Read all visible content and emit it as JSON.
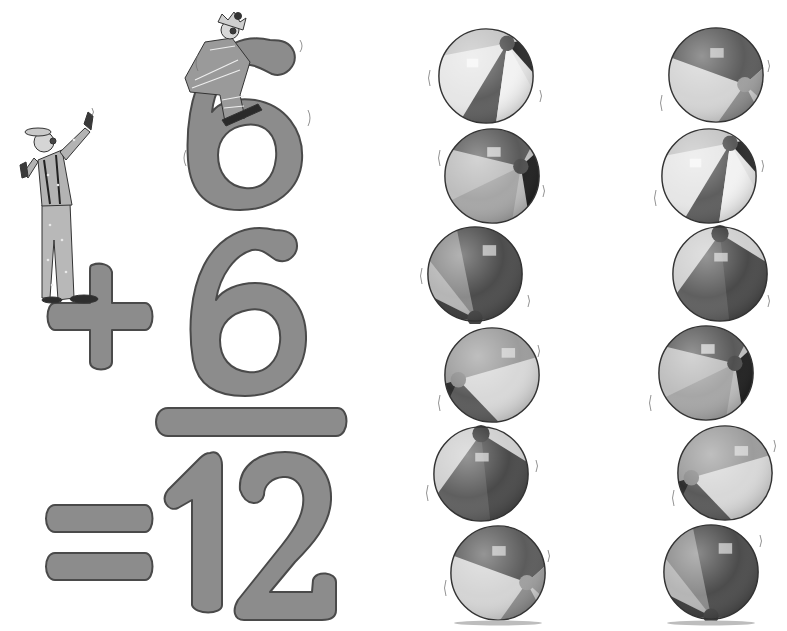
{
  "card": {
    "title": "6 + 6 = 12",
    "addend_top": "6",
    "operator": "+",
    "addend_bottom": "6",
    "equals": "=",
    "sum": "12"
  },
  "figures": {
    "clown_standing": "clown-standing",
    "clown_sitting": "clown-sitting"
  },
  "balls": {
    "left_column_count": 6,
    "right_column_count": 6,
    "total": 12
  },
  "colors": {
    "numeral_fill": "#8c8c8c",
    "numeral_stroke": "#4a4a4a",
    "background": "#ffffff",
    "ball_dark": "#5c5c5c",
    "ball_mid": "#9a9a9a",
    "ball_light": "#d8d8d8"
  }
}
